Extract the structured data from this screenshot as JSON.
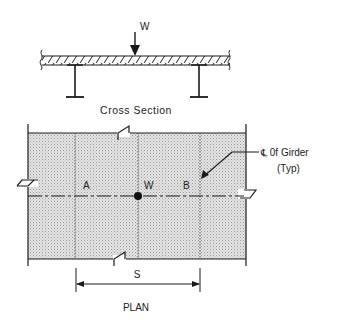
{
  "cross_section": {
    "title": "Cross Section",
    "load_label": "W"
  },
  "plan": {
    "title": "PLAN",
    "girder_a_label": "A",
    "girder_b_label": "B",
    "load_label": "W",
    "spacing_label": "S",
    "callout_line1": "℄ 0f Girder",
    "callout_line2": "(Typ)"
  },
  "colors": {
    "line": "#1a1a1a",
    "slab_fill": "#d9d9d9",
    "background": "#ffffff"
  }
}
